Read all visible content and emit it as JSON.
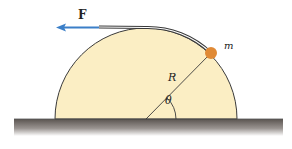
{
  "figure": {
    "labels": {
      "force": "F",
      "mass": "m",
      "radius": "R",
      "angle": "θ"
    },
    "colors": {
      "hemisphere_fill": "#fbeec4",
      "outline": "#3a3a3a",
      "force_arrow": "#3b7fc8",
      "mass": "#e08a36",
      "ground_top": "#5a5450",
      "ground_bottom": "#ffffff"
    }
  }
}
